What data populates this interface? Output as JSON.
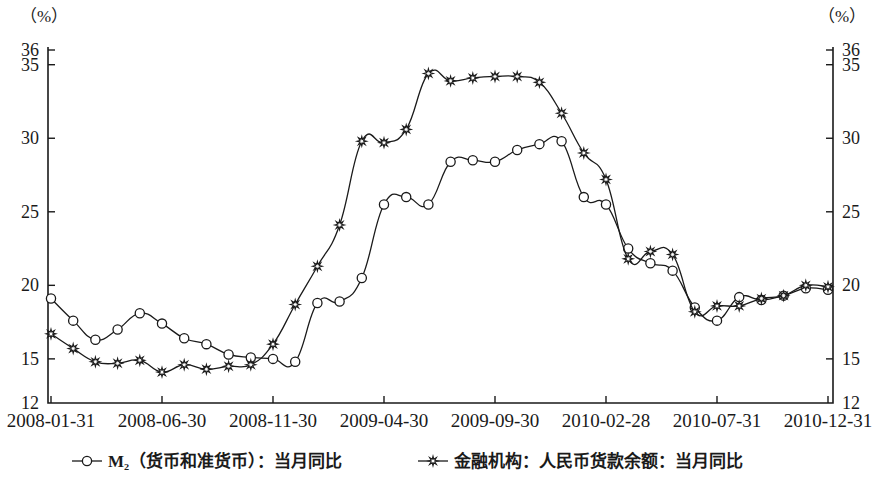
{
  "axis": {
    "unit_left": "（%）",
    "unit_right": "（%）",
    "y_ticks": [
      "36",
      "35",
      "30",
      "25",
      "20",
      "15",
      "12"
    ],
    "y_tick_values": [
      36,
      35,
      30,
      25,
      20,
      15,
      12
    ],
    "x_ticks": [
      "2008-01-31",
      "2008-06-30",
      "2008-11-30",
      "2009-04-30",
      "2009-09-30",
      "2010-02-28",
      "2010-07-31",
      "2010-12-31"
    ]
  },
  "legend": {
    "items": [
      {
        "label": "M₂（货币和准货币）：当月同比",
        "marker": "circle-marker"
      },
      {
        "label": "金融机构：人民币货款余额：当月同比",
        "marker": "star-marker"
      }
    ]
  },
  "chart_data": {
    "type": "line",
    "title": "",
    "subtitle": "",
    "xlabel": "",
    "ylabel": "（%）",
    "ylim": [
      12,
      36
    ],
    "grid": false,
    "legend_position": "bottom",
    "x": [
      "2008-01-31",
      "2008-02-29",
      "2008-03-31",
      "2008-04-30",
      "2008-05-31",
      "2008-06-30",
      "2008-07-31",
      "2008-08-31",
      "2008-09-30",
      "2008-10-31",
      "2008-11-30",
      "2008-12-31",
      "2009-01-31",
      "2009-02-28",
      "2009-03-31",
      "2009-04-30",
      "2009-05-31",
      "2009-06-30",
      "2009-07-31",
      "2009-08-31",
      "2009-09-30",
      "2009-10-31",
      "2009-11-30",
      "2009-12-31",
      "2010-01-31",
      "2010-02-28",
      "2010-03-31",
      "2010-04-30",
      "2010-05-31",
      "2010-06-30",
      "2010-07-31",
      "2010-08-31",
      "2010-09-30",
      "2010-10-31",
      "2010-11-30",
      "2010-12-31"
    ],
    "x_tick_labels": [
      "2008-01-31",
      "2008-06-30",
      "2008-11-30",
      "2009-04-30",
      "2009-09-30",
      "2010-02-28",
      "2010-07-31",
      "2010-12-31"
    ],
    "x_tick_indices": [
      0,
      5,
      10,
      15,
      20,
      25,
      30,
      35
    ],
    "series": [
      {
        "name": "M₂（货币和准货币）：当月同比",
        "marker": "circle",
        "values": [
          19.1,
          17.6,
          16.3,
          17.0,
          18.1,
          17.4,
          16.4,
          16.0,
          15.3,
          15.1,
          15.0,
          14.8,
          18.8,
          18.9,
          20.5,
          25.5,
          26.0,
          25.5,
          28.4,
          28.5,
          28.4,
          29.2,
          29.6,
          29.8,
          26.0,
          25.5,
          22.5,
          21.5,
          21.0,
          18.5,
          17.6,
          19.2,
          19.0,
          19.3,
          19.8,
          19.7
        ]
      },
      {
        "name": "金融机构：人民币货款余额：当月同比",
        "marker": "star",
        "values": [
          16.7,
          15.7,
          14.8,
          14.7,
          14.9,
          14.1,
          14.6,
          14.3,
          14.5,
          14.6,
          16.0,
          18.7,
          21.3,
          24.1,
          29.8,
          29.7,
          30.6,
          34.4,
          33.9,
          34.1,
          34.2,
          34.2,
          33.8,
          31.7,
          29.0,
          27.2,
          21.8,
          22.3,
          22.1,
          18.2,
          18.6,
          18.6,
          19.1,
          19.3,
          20.0,
          19.9
        ]
      }
    ]
  }
}
